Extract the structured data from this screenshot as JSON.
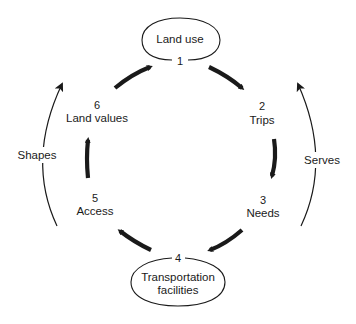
{
  "diagram": {
    "type": "cycle",
    "nodes": [
      {
        "number": "1",
        "label": "Land use",
        "boxed": true
      },
      {
        "number": "2",
        "label": "Trips",
        "boxed": false
      },
      {
        "number": "3",
        "label": "Needs",
        "boxed": false
      },
      {
        "number": "4",
        "label_line1": "Transportation",
        "label_line2": "facilities",
        "boxed": true
      },
      {
        "number": "5",
        "label": "Access",
        "boxed": false
      },
      {
        "number": "6",
        "label": "Land values",
        "boxed": false
      }
    ],
    "edges": [
      {
        "from": "1",
        "to": "2"
      },
      {
        "from": "2",
        "to": "3"
      },
      {
        "from": "3",
        "to": "4"
      },
      {
        "from": "4",
        "to": "5"
      },
      {
        "from": "5",
        "to": "6"
      },
      {
        "from": "6",
        "to": "1"
      }
    ],
    "outer_arcs": [
      {
        "label": "Shapes",
        "side": "left",
        "from": "Transportation facilities",
        "to": "Land use"
      },
      {
        "label": "Serves",
        "side": "right",
        "from": "Transportation facilities",
        "to": "Land use"
      }
    ],
    "colors": {
      "ink": "#1a1a1a",
      "background": "#ffffff"
    }
  }
}
